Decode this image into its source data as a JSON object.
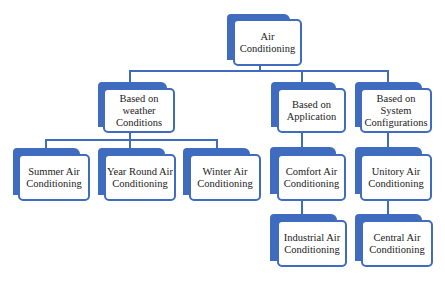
{
  "diagram": {
    "title": "Air Conditioning",
    "accent_color": "#3f6cbf",
    "nodes": {
      "root": {
        "label": "Air\nConditioning"
      },
      "weather": {
        "label": "Based on\nweather\nConditions"
      },
      "application": {
        "label": "Based on\nApplication"
      },
      "system": {
        "label": "Based on\nSystem\nConfigurations"
      },
      "summer": {
        "label": "Summer Air\nConditioning"
      },
      "year_round": {
        "label": "Year Round Air\nConditioning"
      },
      "winter": {
        "label": "Winter Air\nConditioning"
      },
      "comfort": {
        "label": "Comfort Air\nConditioning"
      },
      "industrial": {
        "label": "Industrial Air\nConditioning"
      },
      "unitory": {
        "label": "Unitory Air\nConditioning"
      },
      "central": {
        "label": "Central Air\nConditioning"
      }
    },
    "edges": [
      [
        "root",
        "weather"
      ],
      [
        "root",
        "application"
      ],
      [
        "root",
        "system"
      ],
      [
        "weather",
        "summer"
      ],
      [
        "weather",
        "year_round"
      ],
      [
        "weather",
        "winter"
      ],
      [
        "application",
        "comfort"
      ],
      [
        "comfort",
        "industrial"
      ],
      [
        "system",
        "unitory"
      ],
      [
        "unitory",
        "central"
      ]
    ]
  }
}
